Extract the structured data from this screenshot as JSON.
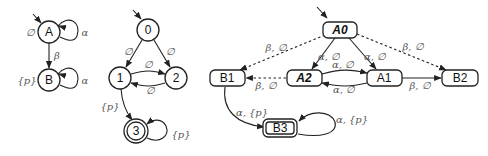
{
  "diagram1": {
    "nodes": [
      {
        "id": "A",
        "label": "A",
        "annotation": "∅"
      },
      {
        "id": "B",
        "label": "B",
        "annotation": "{p}"
      }
    ],
    "edges": [
      {
        "from": "A",
        "to": "A",
        "label": "α"
      },
      {
        "from": "A",
        "to": "B",
        "label": "β"
      },
      {
        "from": "B",
        "to": "B",
        "label": "α"
      }
    ]
  },
  "diagram2": {
    "nodes": [
      {
        "id": "0",
        "label": "0"
      },
      {
        "id": "1",
        "label": "1"
      },
      {
        "id": "2",
        "label": "2"
      },
      {
        "id": "3",
        "label": "3",
        "accepting": true
      }
    ],
    "edges": [
      {
        "from": "0",
        "to": "1",
        "label": "∅"
      },
      {
        "from": "0",
        "to": "2",
        "label": "∅"
      },
      {
        "from": "1",
        "to": "2",
        "label": "∅"
      },
      {
        "from": "2",
        "to": "1",
        "label": "∅"
      },
      {
        "from": "1",
        "to": "3",
        "label": "{p}"
      },
      {
        "from": "3",
        "to": "3",
        "label": "{p}"
      }
    ]
  },
  "diagram3": {
    "nodes": [
      {
        "id": "A0",
        "label": "A0"
      },
      {
        "id": "A1",
        "label": "A1"
      },
      {
        "id": "A2",
        "label": "A2"
      },
      {
        "id": "B1",
        "label": "B1"
      },
      {
        "id": "B2",
        "label": "B2"
      },
      {
        "id": "B3",
        "label": "B3",
        "accepting": true
      }
    ],
    "edges": [
      {
        "from": "A0",
        "to": "B1",
        "label": "β, ∅",
        "style": "dashed"
      },
      {
        "from": "A0",
        "to": "A2",
        "label": "α, ∅"
      },
      {
        "from": "A0",
        "to": "A1",
        "label": "α, ∅"
      },
      {
        "from": "A0",
        "to": "B2",
        "label": "β, ∅",
        "style": "dashed"
      },
      {
        "from": "A2",
        "to": "A1",
        "label": "α, ∅"
      },
      {
        "from": "A1",
        "to": "A2",
        "label": "α, ∅"
      },
      {
        "from": "A2",
        "to": "B1",
        "label": "β, ∅",
        "style": "dashed"
      },
      {
        "from": "A1",
        "to": "B2",
        "label": "β, ∅"
      },
      {
        "from": "B1",
        "to": "B3",
        "label": "α, {p}"
      },
      {
        "from": "B3",
        "to": "B3",
        "label": "α, {p}"
      }
    ]
  }
}
